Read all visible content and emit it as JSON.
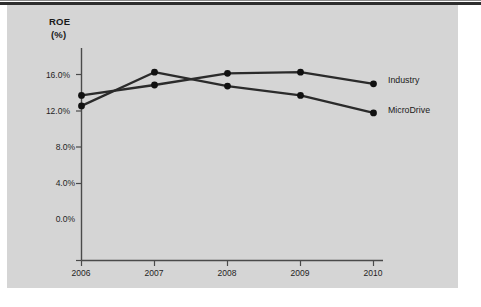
{
  "figure": {
    "panel_color": "#d5d5d5",
    "background_color": "#ffffff",
    "rule_color": "#2e2e2e",
    "line_color": "#2b2b2b",
    "marker_color": "#111111"
  },
  "axis": {
    "y_title": "ROE",
    "y_unit": "(%)",
    "y_ticks": [
      "0.0%",
      "4.0%",
      "8.0%",
      "12.0%",
      "16.0%"
    ],
    "x_ticks": [
      "2006",
      "2007",
      "2008",
      "2009",
      "2010"
    ]
  },
  "labels": {
    "industry": "Industry",
    "microdrive": "MicroDrive"
  },
  "chart_data": {
    "type": "line",
    "title": "",
    "subtitle": "",
    "xlabel": "",
    "ylabel": "ROE (%)",
    "x": [
      "2006",
      "2007",
      "2008",
      "2009",
      "2010"
    ],
    "categories": [
      "2006",
      "2007",
      "2008",
      "2009",
      "2010"
    ],
    "ylim": [
      0.0,
      18.0
    ],
    "ytick_values": [
      0.0,
      4.0,
      8.0,
      12.0,
      16.0
    ],
    "ytick_labels": [
      "0.0%",
      "4.0%",
      "8.0%",
      "12.0%",
      "16.0%"
    ],
    "grid": false,
    "legend_position": "right-of-line-ends",
    "series": [
      {
        "name": "MicroDrive",
        "values": [
          13.3,
          16.2,
          15.0,
          14.2,
          12.7
        ],
        "color": "#2b2b2b",
        "marker": "circle"
      },
      {
        "name": "Industry",
        "values": [
          14.2,
          15.1,
          16.1,
          16.2,
          15.2
        ],
        "color": "#2b2b2b",
        "marker": "circle"
      }
    ]
  }
}
